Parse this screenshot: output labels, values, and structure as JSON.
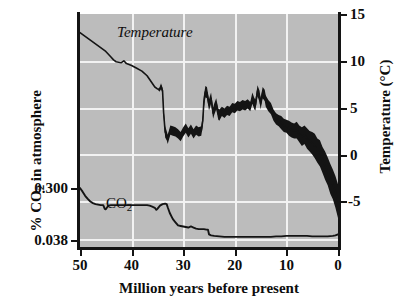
{
  "figure": {
    "background_color": "#ffffff",
    "plot_background_color": "#bcbcbc",
    "gridline_color": "#f2f2f2",
    "line_color": "#141414"
  },
  "annotations": {
    "temperature_label": "Temperature",
    "co2_label_main": "CO",
    "co2_label_sub": "2"
  },
  "axis_titles": {
    "left_prefix": "% CO",
    "left_sub": "2",
    "left_suffix": " in atmosphere",
    "right_prefix": "Temperature (",
    "right_degree": "°C)",
    "bottom": "Million years before present"
  },
  "ticks": {
    "left_labels": [
      "0.300",
      "0.038"
    ],
    "right_labels": [
      "15",
      "10",
      "5",
      "0",
      "-5"
    ],
    "bottom_labels": [
      "50",
      "40",
      "30",
      "20",
      "10",
      "0"
    ]
  },
  "chart_data": {
    "type": "line",
    "title": "",
    "subtitle": "",
    "xlabel": "Million years before present",
    "ylabel": "% CO2 in atmosphere",
    "y2label": "Temperature (°C)",
    "grid": true,
    "legend": "inline-annotations",
    "x_axis": {
      "label": "Million years before present",
      "ticks": [
        50,
        40,
        30,
        20,
        10,
        0
      ],
      "range": [
        50,
        0
      ],
      "direction": "reversed",
      "units": "million years before present"
    },
    "y_axis_left": {
      "label": "% CO2 in atmosphere",
      "ticks": [
        0.3,
        0.038
      ],
      "tick_labels": [
        "0.300",
        "0.038"
      ],
      "tick_pixel_note": "0.300 gridline near lower-middle of plot; 0.038 near plot bottom",
      "units": "percent of atmosphere"
    },
    "y_axis_right": {
      "label": "Temperature (°C)",
      "ticks": [
        15,
        10,
        5,
        0,
        -5
      ],
      "range": [
        -10,
        15
      ],
      "units": "degrees Celsius"
    },
    "series": [
      {
        "name": "Temperature",
        "axis": "right",
        "units": "°C",
        "style": "thin line before ~34 Ma, thick jagged band after",
        "x": [
          50.0,
          49.0,
          48.0,
          47.0,
          46.0,
          45.0,
          44.0,
          43.5,
          43.0,
          42.0,
          41.5,
          41.0,
          40.0,
          39.0,
          38.0,
          37.0,
          36.5,
          36.0,
          35.5,
          35.0,
          34.6,
          34.3,
          34.0,
          33.8,
          33.5,
          33.2,
          33.0,
          32.5,
          32.0,
          31.5,
          31.0,
          30.5,
          30.0,
          29.5,
          29.0,
          28.5,
          28.0,
          27.5,
          27.0,
          26.5,
          26.2,
          26.0,
          25.7,
          25.4,
          25.0,
          24.6,
          24.2,
          24.0,
          23.6,
          23.2,
          23.0,
          22.5,
          22.0,
          21.5,
          21.0,
          20.5,
          20.0,
          19.5,
          19.0,
          18.5,
          18.0,
          17.5,
          17.0,
          16.6,
          16.2,
          16.0,
          15.6,
          15.2,
          15.0,
          14.6,
          14.2,
          14.0,
          13.5,
          13.0,
          12.5,
          12.0,
          11.5,
          11.0,
          10.5,
          10.0,
          9.5,
          9.0,
          8.5,
          8.0,
          7.5,
          7.0,
          6.5,
          6.0,
          5.5,
          5.0,
          4.5,
          4.0,
          3.5,
          3.0,
          2.5,
          2.0,
          1.5,
          1.0,
          0.5,
          0.0
        ],
        "values": [
          13.0,
          12.6,
          12.2,
          11.8,
          11.4,
          11.0,
          10.4,
          10.1,
          9.9,
          9.8,
          10.0,
          9.7,
          9.5,
          9.2,
          8.9,
          8.4,
          8.0,
          7.6,
          7.2,
          7.0,
          6.9,
          7.3,
          6.8,
          4.5,
          2.4,
          2.0,
          1.6,
          2.6,
          2.5,
          2.4,
          2.2,
          1.9,
          2.4,
          2.8,
          2.3,
          2.7,
          2.2,
          2.6,
          2.4,
          2.5,
          3.6,
          5.6,
          6.7,
          6.6,
          5.3,
          6.0,
          4.4,
          4.8,
          5.4,
          4.3,
          4.2,
          4.6,
          4.4,
          4.7,
          4.6,
          5.0,
          4.9,
          5.2,
          5.1,
          5.3,
          5.2,
          5.4,
          5.1,
          6.0,
          5.4,
          5.3,
          6.8,
          6.2,
          5.4,
          6.6,
          6.3,
          5.7,
          5.2,
          4.9,
          4.2,
          3.8,
          3.6,
          3.4,
          3.1,
          3.0,
          2.8,
          2.6,
          2.5,
          2.6,
          2.2,
          1.9,
          2.1,
          1.7,
          1.4,
          1.2,
          0.9,
          0.4,
          0.1,
          -0.6,
          -1.2,
          -1.8,
          -2.6,
          -3.2,
          -4.0,
          -5.0
        ],
        "band_halfwidth": [
          0.0,
          0.0,
          0.0,
          0.0,
          0.0,
          0.0,
          0.0,
          0.0,
          0.0,
          0.0,
          0.0,
          0.0,
          0.0,
          0.0,
          0.0,
          0.0,
          0.0,
          0.0,
          0.0,
          0.0,
          0.2,
          0.3,
          0.3,
          0.4,
          0.6,
          0.5,
          0.5,
          0.5,
          0.5,
          0.5,
          0.5,
          0.5,
          0.5,
          0.5,
          0.5,
          0.5,
          0.5,
          0.5,
          0.5,
          0.5,
          0.6,
          0.7,
          0.6,
          0.6,
          0.6,
          0.6,
          0.6,
          0.6,
          0.6,
          0.6,
          0.6,
          0.5,
          0.5,
          0.5,
          0.5,
          0.5,
          0.5,
          0.5,
          0.5,
          0.5,
          0.5,
          0.5,
          0.5,
          0.6,
          0.6,
          0.6,
          0.6,
          0.6,
          0.6,
          0.6,
          0.6,
          0.6,
          0.6,
          0.6,
          0.6,
          0.6,
          0.6,
          0.7,
          0.7,
          0.7,
          0.8,
          0.8,
          0.8,
          0.9,
          0.9,
          1.0,
          1.0,
          1.1,
          1.1,
          1.2,
          1.3,
          1.3,
          1.4,
          1.4,
          1.5,
          1.5,
          1.6,
          1.6,
          1.7,
          1.8
        ]
      },
      {
        "name": "CO2",
        "axis": "left",
        "units": "% of atmosphere",
        "style": "thin solid line",
        "x": [
          50.0,
          49.5,
          49.0,
          48.5,
          48.0,
          47.5,
          47.0,
          46.5,
          46.0,
          45.5,
          45.2,
          45.0,
          44.8,
          44.5,
          44.0,
          43.0,
          42.0,
          41.0,
          40.0,
          39.0,
          38.0,
          37.0,
          36.5,
          36.0,
          35.5,
          35.2,
          35.0,
          34.5,
          34.0,
          33.5,
          33.2,
          33.0,
          32.6,
          32.2,
          32.0,
          31.5,
          31.0,
          30.5,
          30.0,
          29.5,
          29.0,
          28.5,
          28.0,
          27.5,
          27.0,
          26.5,
          26.0,
          25.5,
          25.2,
          25.0,
          24.6,
          24.0,
          23.0,
          22.0,
          21.0,
          20.0,
          19.0,
          18.0,
          17.0,
          16.0,
          15.0,
          14.0,
          13.0,
          12.0,
          11.0,
          10.0,
          9.0,
          8.0,
          7.0,
          6.0,
          5.0,
          4.0,
          3.0,
          2.0,
          1.0,
          0.5,
          0.0
        ],
        "values_relative": [
          1.0,
          0.93,
          0.85,
          0.79,
          0.74,
          0.71,
          0.69,
          0.68,
          0.67,
          0.67,
          0.6,
          0.59,
          0.62,
          0.66,
          0.67,
          0.67,
          0.67,
          0.67,
          0.67,
          0.67,
          0.67,
          0.67,
          0.66,
          0.64,
          0.62,
          0.58,
          0.6,
          0.66,
          0.69,
          0.7,
          0.69,
          0.63,
          0.52,
          0.44,
          0.4,
          0.34,
          0.28,
          0.27,
          0.26,
          0.25,
          0.24,
          0.26,
          0.24,
          0.22,
          0.21,
          0.21,
          0.21,
          0.2,
          0.2,
          0.11,
          0.09,
          0.08,
          0.07,
          0.06,
          0.06,
          0.06,
          0.06,
          0.06,
          0.06,
          0.06,
          0.06,
          0.06,
          0.06,
          0.07,
          0.07,
          0.08,
          0.08,
          0.08,
          0.08,
          0.08,
          0.07,
          0.07,
          0.07,
          0.07,
          0.08,
          0.09,
          0.11
        ],
        "note": "values_relative is fraction of the span between the 0.038 and 0.300 gridlines; 0 = 0.038, 1 = 0.300"
      }
    ],
    "annotations": [
      {
        "text": "Temperature",
        "x": 44,
        "series": "Temperature",
        "style": "italic"
      },
      {
        "text": "CO2",
        "x": 46,
        "series": "CO2",
        "style": "roman with subscript"
      }
    ]
  }
}
